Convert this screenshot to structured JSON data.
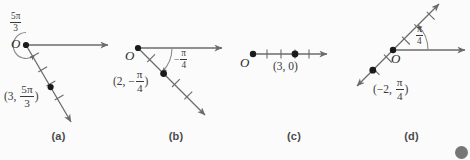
{
  "figure": {
    "background_color": "#fbfbfb",
    "stroke_color": "#6b6b6b",
    "dot_color": "#1a1a1a",
    "text_color": "#3a3a3a",
    "width": 470,
    "height": 160
  },
  "panels": [
    {
      "id": "a",
      "caption": "(a)",
      "origin_label": "O",
      "angle": {
        "numerator": "5π",
        "denominator": "3",
        "sign": ""
      },
      "coordinate": {
        "open": "(",
        "radius": "3",
        "comma": ",",
        "numerator": "5π",
        "denominator": "3",
        "close": ")"
      },
      "point": {
        "r": 3,
        "theta_deg": -60
      },
      "ticks": 4,
      "rotation_arc": "counterclockwise-300deg",
      "has_initial_ray": true,
      "terminal_ray": "down-right"
    },
    {
      "id": "b",
      "caption": "(b)",
      "origin_label": "O",
      "angle": {
        "numerator": "π",
        "denominator": "4",
        "sign": "−"
      },
      "coordinate": {
        "open": "(",
        "radius": "2",
        "comma": ",",
        "sign": "−",
        "numerator": "π",
        "denominator": "4",
        "close": ")"
      },
      "point": {
        "r": 2,
        "theta_deg": -45
      },
      "ticks": 3,
      "rotation_arc": "clockwise-45deg",
      "has_initial_ray": true,
      "terminal_ray": "down-right"
    },
    {
      "id": "c",
      "caption": "(c)",
      "origin_label": "O",
      "angle": null,
      "coordinate": {
        "open": "(",
        "radius": "3",
        "comma": ",",
        "theta": "0",
        "close": ")"
      },
      "point": {
        "r": 3,
        "theta_deg": 0
      },
      "ticks": 4,
      "rotation_arc": null,
      "has_initial_ray": true,
      "terminal_ray": "right"
    },
    {
      "id": "d",
      "caption": "(d)",
      "origin_label": "O",
      "angle": {
        "numerator": "π",
        "denominator": "4",
        "sign": ""
      },
      "coordinate": {
        "open": "(",
        "radius": "−2",
        "comma": ",",
        "numerator": "π",
        "denominator": "4",
        "close": ")"
      },
      "point": {
        "r": -2,
        "theta_deg": 45
      },
      "ticks": 5,
      "rotation_arc": "counterclockwise-45deg",
      "has_initial_ray": true,
      "terminal_ray": "up-right-and-extension-down-left"
    }
  ]
}
